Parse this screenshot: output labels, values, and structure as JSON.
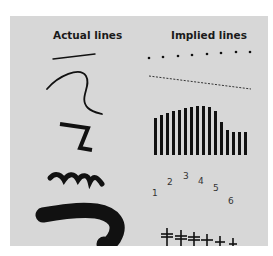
{
  "headers": {
    "actual": "Actual lines",
    "implied": "Implied lines"
  },
  "implied": {
    "numbers": [
      "1",
      "2",
      "3",
      "4",
      "5",
      "6"
    ]
  },
  "colors": {
    "background": "#d7d7d7",
    "ink": "#111111"
  }
}
